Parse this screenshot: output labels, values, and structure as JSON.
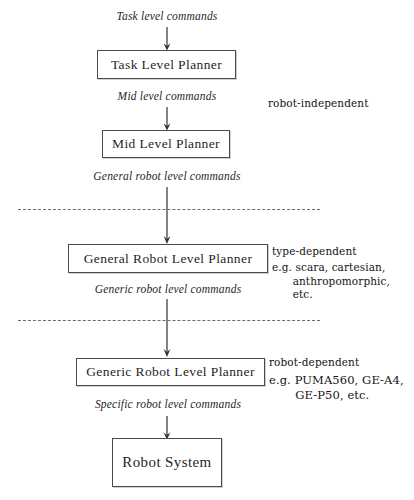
{
  "diagram": {
    "nodes": [
      {
        "id": "task",
        "label": "Task Level Planner"
      },
      {
        "id": "mid",
        "label": "Mid Level Planner"
      },
      {
        "id": "general",
        "label": "General Robot Level Planner"
      },
      {
        "id": "generic",
        "label": "Generic Robot Level Planner"
      },
      {
        "id": "system",
        "label": "Robot System"
      }
    ],
    "flow_labels": [
      {
        "id": "task-cmd",
        "text": "Task level commands"
      },
      {
        "id": "mid-cmd",
        "text": "Mid level commands"
      },
      {
        "id": "general-cmd",
        "text": "General robot level commands"
      },
      {
        "id": "generic-cmd",
        "text": "Generic robot level commands"
      },
      {
        "id": "specific-cmd",
        "text": "Specific robot level commands"
      }
    ],
    "side_notes": [
      {
        "id": "robot-independent",
        "heading": "robot-independent",
        "examples": ""
      },
      {
        "id": "type-dependent",
        "heading": "type-dependent",
        "examples": "e.g. scara, cartesian,\n      anthropomorphic,\n      etc."
      },
      {
        "id": "robot-dependent",
        "heading": "robot-dependent",
        "examples": "e.g. PUMA560, GE-A4,\n       GE-P50, etc."
      }
    ],
    "separators": [
      {
        "id": "separator-upper"
      },
      {
        "id": "separator-lower"
      }
    ],
    "colors": {
      "ink": "#1f1f1f",
      "box_border": "#4a4a4a",
      "dashed_rule": "#6c6c6c",
      "background": "#ffffff"
    }
  }
}
